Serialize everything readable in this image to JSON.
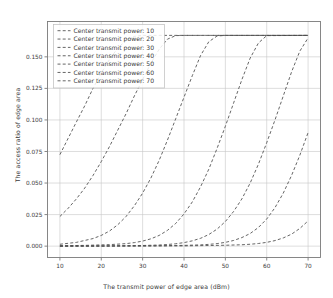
{
  "chart_data": {
    "type": "line",
    "title": "",
    "xlabel": "The transmit power of edge area (dBm)",
    "ylabel": "The access ratio of edge area",
    "xlim": [
      7,
      73
    ],
    "ylim": [
      -0.009,
      0.178
    ],
    "xticks": [
      10,
      20,
      30,
      40,
      50,
      60,
      70
    ],
    "xticklabels": [
      "10",
      "20",
      "30",
      "40",
      "50",
      "60",
      "70"
    ],
    "yticks": [
      0.0,
      0.025,
      0.05,
      0.075,
      0.1,
      0.125,
      0.15
    ],
    "yticklabels": [
      "0.000",
      "0.025",
      "0.050",
      "0.075",
      "0.100",
      "0.125",
      "0.150"
    ],
    "grid": true,
    "legend_position": "upper left",
    "legend_title": "",
    "saturation_value": 0.167,
    "line_style": "dashed",
    "line_color": "#4a4a4a",
    "series": [
      {
        "name": "Center transmit power: 10",
        "x": [
          10,
          12,
          14,
          16,
          18,
          20,
          22,
          24,
          26,
          28,
          30,
          32,
          34,
          36,
          40,
          50,
          60,
          70
        ],
        "values": [
          0.0725,
          0.0855,
          0.0985,
          0.1112,
          0.125,
          0.1372,
          0.148,
          0.157,
          0.163,
          0.1662,
          0.167,
          0.167,
          0.167,
          0.167,
          0.167,
          0.167,
          0.167,
          0.167
        ]
      },
      {
        "name": "Center transmit power: 20",
        "x": [
          10,
          12,
          14,
          16,
          18,
          20,
          22,
          24,
          26,
          28,
          30,
          32,
          34,
          36,
          38,
          40,
          45,
          50,
          60,
          70
        ],
        "values": [
          0.0235,
          0.03,
          0.0375,
          0.046,
          0.056,
          0.067,
          0.079,
          0.092,
          0.105,
          0.119,
          0.132,
          0.145,
          0.156,
          0.164,
          0.1668,
          0.167,
          0.167,
          0.167,
          0.167,
          0.167
        ]
      },
      {
        "name": "Center transmit power: 30",
        "x": [
          10,
          14,
          18,
          20,
          22,
          24,
          26,
          28,
          30,
          32,
          34,
          36,
          38,
          40,
          42,
          44,
          46,
          48,
          50,
          60,
          70
        ],
        "values": [
          0.0015,
          0.003,
          0.006,
          0.0085,
          0.012,
          0.017,
          0.0235,
          0.032,
          0.042,
          0.054,
          0.068,
          0.084,
          0.101,
          0.118,
          0.135,
          0.151,
          0.162,
          0.1665,
          0.167,
          0.167,
          0.167
        ]
      },
      {
        "name": "Center transmit power: 40",
        "x": [
          10,
          16,
          22,
          26,
          28,
          30,
          32,
          34,
          36,
          38,
          40,
          42,
          44,
          46,
          48,
          50,
          52,
          54,
          56,
          58,
          60,
          70
        ],
        "values": [
          0.0003,
          0.0006,
          0.0012,
          0.002,
          0.0028,
          0.004,
          0.0058,
          0.0085,
          0.0125,
          0.018,
          0.0255,
          0.035,
          0.047,
          0.061,
          0.0775,
          0.095,
          0.1135,
          0.132,
          0.149,
          0.161,
          0.1668,
          0.167
        ]
      },
      {
        "name": "Center transmit power: 50",
        "x": [
          10,
          20,
          30,
          34,
          36,
          38,
          40,
          42,
          44,
          46,
          48,
          50,
          52,
          54,
          56,
          58,
          60,
          62,
          64,
          66,
          68,
          70
        ],
        "values": [
          0.0001,
          0.0002,
          0.0005,
          0.0009,
          0.0013,
          0.0019,
          0.0028,
          0.0042,
          0.0062,
          0.0092,
          0.0135,
          0.0195,
          0.0275,
          0.0375,
          0.05,
          0.065,
          0.082,
          0.1,
          0.119,
          0.138,
          0.1545,
          0.165
        ]
      },
      {
        "name": "Center transmit power: 60",
        "x": [
          10,
          20,
          30,
          40,
          44,
          46,
          48,
          50,
          52,
          54,
          56,
          58,
          60,
          62,
          64,
          66,
          68,
          70
        ],
        "values": [
          0.0,
          0.0001,
          0.0002,
          0.0006,
          0.001,
          0.0014,
          0.002,
          0.003,
          0.0045,
          0.0068,
          0.01,
          0.0148,
          0.0215,
          0.0305,
          0.042,
          0.056,
          0.072,
          0.09
        ]
      },
      {
        "name": "Center transmit power: 70",
        "x": [
          10,
          20,
          30,
          40,
          50,
          54,
          56,
          58,
          60,
          62,
          64,
          66,
          68,
          70
        ],
        "values": [
          0.0,
          0.0,
          0.0001,
          0.0002,
          0.0007,
          0.0011,
          0.0015,
          0.0021,
          0.003,
          0.0044,
          0.0065,
          0.0095,
          0.014,
          0.02
        ]
      }
    ],
    "legend_entries": [
      "Center transmit power: 10",
      "Center transmit power: 20",
      "Center transmit power: 30",
      "Center transmit power: 40",
      "Center transmit power: 50",
      "Center transmit power: 60",
      "Center transmit power: 70"
    ]
  }
}
